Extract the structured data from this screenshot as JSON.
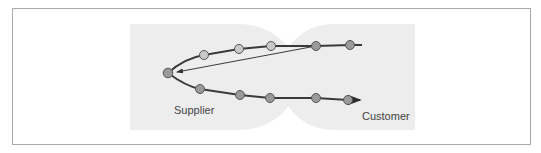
{
  "diagram": {
    "type": "supplier-customer relationship loop",
    "labels": {
      "supplier": "Supplier",
      "customer": "Customer"
    },
    "colors": {
      "frame_border": "#a8a8a8",
      "region_fill": "#ededed",
      "path_stroke": "#3a3a3a",
      "node_light": "#c9c9c9",
      "node_dark": "#9a9a9a",
      "node_stroke": "#555555"
    },
    "regions": [
      {
        "name": "supplier-region",
        "label": "Supplier"
      },
      {
        "name": "customer-region",
        "label": "Customer"
      }
    ],
    "upper_path_nodes": [
      {
        "x": 204,
        "y": 55,
        "shade": "light"
      },
      {
        "x": 239,
        "y": 49,
        "shade": "light"
      },
      {
        "x": 271,
        "y": 46,
        "shade": "light"
      },
      {
        "x": 316,
        "y": 46,
        "shade": "dark"
      },
      {
        "x": 350,
        "y": 45,
        "shade": "dark"
      }
    ],
    "apex_node": {
      "x": 168,
      "y": 73,
      "shade": "dark"
    },
    "lower_path_nodes": [
      {
        "x": 200,
        "y": 89,
        "shade": "dark"
      },
      {
        "x": 240,
        "y": 95,
        "shade": "dark"
      },
      {
        "x": 270,
        "y": 98,
        "shade": "dark"
      },
      {
        "x": 316,
        "y": 98,
        "shade": "dark"
      },
      {
        "x": 348,
        "y": 100,
        "shade": "dark"
      }
    ],
    "return_arrow": {
      "from": [
        316,
        46
      ],
      "to": [
        176,
        72
      ]
    },
    "outgoing_arrow_tip": [
      362,
      100
    ]
  }
}
